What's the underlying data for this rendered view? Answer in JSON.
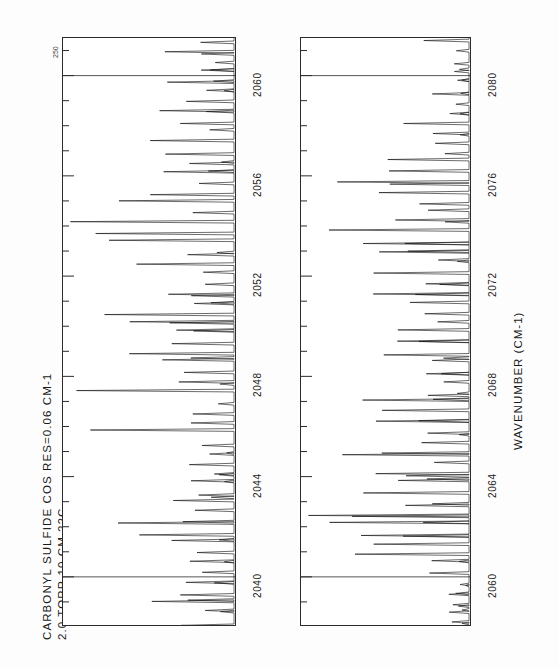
{
  "figure": {
    "number": "250",
    "orientation": "rotated-90-ccw"
  },
  "caption": {
    "line1": "CARBONYL SULFIDE    COS      RES=0.06 CM-1",
    "line2": "2.0 TORR   10 CM   22C"
  },
  "axis": {
    "title": "WAVENUMBER (CM-1)"
  },
  "colors": {
    "trace": "#101010",
    "frame": "#2b2b2b",
    "background": "#ffffff"
  },
  "chart_data": {
    "type": "line",
    "title": "CARBONYL SULFIDE    COS      RES=0.06 CM-1",
    "subtitle": "2.0 TORR   10 CM   22C",
    "xlabel": "WAVENUMBER (CM-1)",
    "ylabel": "TRANSMITTANCE",
    "grid": false,
    "legend": null,
    "orientation": "x-axis vertical (figure rotated 90 deg counter-clockwise)",
    "panels": [
      {
        "name": "upper-panel",
        "xlim": [
          2038.0,
          2061.5
        ],
        "ylim": [
          0.0,
          1.0
        ],
        "ticks": [
          2040,
          2044,
          2048,
          2052,
          2056,
          2060
        ],
        "tick_labels": [
          "2040",
          "2044",
          "2048",
          "2052",
          "2056",
          "2060"
        ],
        "minor_tick_spacing": 1,
        "cross_rules": [
          2040,
          2060
        ],
        "band_centers": [
          2041.0,
          2047.5,
          2053.5,
          2058.5
        ],
        "comb_spacing": 0.4,
        "envelope_peak_depth": 0.92
      },
      {
        "name": "lower-panel",
        "xlim": [
          2058.0,
          2081.5
        ],
        "ylim": [
          0.0,
          1.0
        ],
        "ticks": [
          2060,
          2064,
          2068,
          2072,
          2076,
          2080
        ],
        "tick_labels": [
          "2060",
          "2064",
          "2068",
          "2072",
          "2076",
          "2080"
        ],
        "minor_tick_spacing": 1,
        "cross_rules": [
          2060,
          2080
        ],
        "band_centers": [
          2062.0,
          2067.0,
          2071.5,
          2076.0
        ],
        "comb_spacing": 0.4,
        "envelope_peak_depth": 0.95
      }
    ]
  }
}
